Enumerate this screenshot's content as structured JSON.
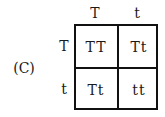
{
  "option_label": "(C)",
  "punnett": {
    "column_headers": [
      "T",
      "t"
    ],
    "row_headers": [
      "T",
      "t"
    ],
    "cells": [
      [
        "TT",
        "Tt"
      ],
      [
        "Tt",
        "tt"
      ]
    ]
  }
}
